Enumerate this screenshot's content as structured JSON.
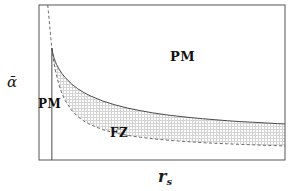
{
  "figure": {
    "title": "",
    "background": "#ffffff",
    "frame_color": "#555555"
  },
  "labels": {
    "ylabel": "ᾱ",
    "xlabel_base": "r",
    "xlabel_sub": "s",
    "xlabel_full": "r_s"
  },
  "regions": [
    {
      "name": "pm-upper",
      "text": "PM"
    },
    {
      "name": "pm-left",
      "text": "PM"
    },
    {
      "name": "fz",
      "text": "FZ"
    }
  ],
  "axes": {
    "xlim": [
      0.9,
      20.6
    ],
    "ylim": [
      0.0,
      0.92
    ],
    "xticks": [
      2.5,
      5,
      7.5,
      10,
      12.5,
      15,
      17.5,
      20
    ],
    "xticklabels": [
      "2.5",
      "5",
      "7.5",
      "10",
      "12.5",
      "15",
      "17.5",
      "20"
    ],
    "yticks": [
      0.2,
      0.4,
      0.6,
      0.8
    ],
    "yticklabels": [
      "0.2",
      "0.4",
      "0.6",
      "0.8"
    ],
    "grid": false
  },
  "chart_data": {
    "type": "line",
    "title": "",
    "xlabel": "r_s",
    "ylabel": "ᾱ",
    "xlim": [
      0.9,
      20.6
    ],
    "ylim": [
      0.0,
      0.92
    ],
    "grid": false,
    "legend": "none",
    "annotations": [
      {
        "text": "PM",
        "x": 13.6,
        "y": 0.655
      },
      {
        "text": "PM",
        "x": 1.35,
        "y": 0.305
      },
      {
        "text": "FZ",
        "x": 6.5,
        "y": 0.145
      }
    ],
    "shaded_region": {
      "name": "FZ-stippled-region",
      "description": "stippled area between the dashed lower boundary and the solid upper boundary, right of the vertical solid line",
      "pattern": "fine dotted grid",
      "color": "#c8c8c8"
    },
    "series": [
      {
        "name": "upper-phase-boundary",
        "style": "solid",
        "color": "#4a4a4a",
        "x": [
          1.93,
          1.95,
          2.0,
          2.1,
          2.2,
          2.3,
          2.5,
          2.75,
          3.0,
          3.5,
          4.0,
          4.5,
          5.0,
          6.0,
          7.0,
          8.0,
          9.0,
          10.0,
          11.0,
          12.0,
          13.0,
          14.0,
          15.0,
          16.0,
          17.0,
          18.0,
          19.0,
          20.0,
          20.6
        ],
        "y": [
          0.665,
          0.655,
          0.635,
          0.607,
          0.586,
          0.568,
          0.54,
          0.512,
          0.489,
          0.452,
          0.423,
          0.4,
          0.381,
          0.35,
          0.327,
          0.308,
          0.293,
          0.28,
          0.269,
          0.26,
          0.252,
          0.245,
          0.239,
          0.233,
          0.228,
          0.224,
          0.22,
          0.216,
          0.214
        ]
      },
      {
        "name": "lower-phase-boundary",
        "style": "dashed",
        "color": "#6a6a6a",
        "x": [
          1.6,
          1.65,
          1.7,
          1.75,
          1.8,
          1.85,
          1.9,
          1.93,
          2.0,
          2.1,
          2.25,
          2.5,
          2.75,
          3.0,
          3.5,
          4.0,
          4.5,
          5.0,
          6.0,
          7.0,
          8.0,
          9.0,
          10.0,
          11.0,
          12.0,
          13.0,
          14.0,
          15.0,
          16.0,
          17.0,
          18.0,
          19.0,
          20.0,
          20.6
        ],
        "y": [
          0.92,
          0.88,
          0.84,
          0.8,
          0.762,
          0.722,
          0.683,
          0.665,
          0.625,
          0.575,
          0.518,
          0.445,
          0.392,
          0.352,
          0.296,
          0.258,
          0.231,
          0.21,
          0.18,
          0.16,
          0.146,
          0.135,
          0.126,
          0.119,
          0.113,
          0.108,
          0.103,
          0.099,
          0.096,
          0.093,
          0.09,
          0.087,
          0.085,
          0.083
        ]
      },
      {
        "name": "vertical-boundary",
        "style": "solid",
        "color": "#4a4a4a",
        "x": [
          1.93,
          1.93
        ],
        "y": [
          0.665,
          0.0
        ]
      }
    ]
  }
}
